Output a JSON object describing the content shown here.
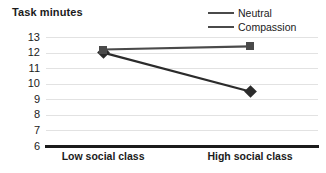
{
  "chart_data": {
    "type": "line",
    "title": "Task minutes",
    "xlabel": "",
    "ylabel": "",
    "categories": [
      "Low social class",
      "High social class"
    ],
    "ylim": [
      6,
      13
    ],
    "yticks": [
      13,
      12,
      11,
      10,
      9,
      8,
      7,
      6
    ],
    "grid": true,
    "legend_position": "top-right",
    "series": [
      {
        "name": "Neutral",
        "marker": "diamond",
        "color": "#2b2b2b",
        "values": [
          12.0,
          9.5
        ]
      },
      {
        "name": "Compassion",
        "marker": "square",
        "color": "#4a4a4a",
        "values": [
          12.2,
          12.4
        ]
      }
    ]
  },
  "legend": {
    "items": [
      {
        "label": "Neutral",
        "marker_icon": "diamond-marker-icon"
      },
      {
        "label": "Compassion",
        "marker_icon": "square-marker-icon"
      }
    ]
  },
  "axis": {
    "y_labels": [
      "13",
      "12",
      "11",
      "10",
      "9",
      "8",
      "7",
      "6"
    ],
    "x_labels": [
      "Low social class",
      "High social class"
    ]
  }
}
